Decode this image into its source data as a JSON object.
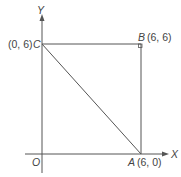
{
  "figure": {
    "axes": {
      "x_label": "X",
      "y_label": "Y",
      "origin_label": "O"
    },
    "points": {
      "A": {
        "name": "A",
        "coords": "(6, 0)"
      },
      "B": {
        "name": "B",
        "coords": "(6, 6)"
      },
      "C": {
        "name": "C",
        "coords": "(0, 6)"
      }
    },
    "colors": {
      "line": "#555555",
      "text": "#444444"
    }
  }
}
